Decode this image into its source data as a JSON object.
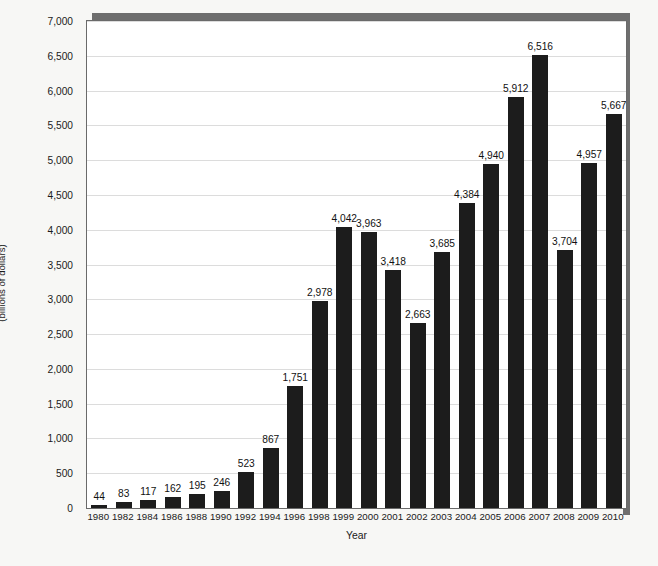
{
  "chart_data": {
    "type": "bar",
    "title": "",
    "xlabel": "Year",
    "ylabel": "Value of stocks owned through equity mutual funds",
    "ylabel_line2": "(billions of dollars)",
    "ylim": [
      0,
      7000
    ],
    "ytick_step": 500,
    "grid": true,
    "legend": "none",
    "bar_color": "#1c1c1c",
    "plot_background": "#ffffff",
    "page_background": "#f7f7f5",
    "shadow_color": "#6e6e6e",
    "yticks": [
      "0",
      "500",
      "1,000",
      "1,500",
      "2,000",
      "2,500",
      "3,000",
      "3,500",
      "4,000",
      "4,500",
      "5,000",
      "5,500",
      "6,000",
      "6,500",
      "7,000"
    ],
    "categories": [
      "1980",
      "1982",
      "1984",
      "1986",
      "1988",
      "1990",
      "1992",
      "1994",
      "1996",
      "1998",
      "1999",
      "2000",
      "2001",
      "2002",
      "2003",
      "2004",
      "2005",
      "2006",
      "2007",
      "2008",
      "2009",
      "2010"
    ],
    "values": [
      44,
      83,
      117,
      162,
      195,
      246,
      523,
      867,
      1751,
      2978,
      4042,
      3963,
      3418,
      2663,
      3685,
      4384,
      4940,
      5912,
      6516,
      3704,
      4957,
      5667
    ],
    "value_labels": [
      "44",
      "83",
      "117",
      "162",
      "195",
      "246",
      "523",
      "867",
      "1,751",
      "2,978",
      "4,042",
      "3,963",
      "3,418",
      "2,663",
      "3,685",
      "4,384",
      "4,940",
      "5,912",
      "6,516",
      "3,704",
      "4,957",
      "5,667"
    ]
  }
}
